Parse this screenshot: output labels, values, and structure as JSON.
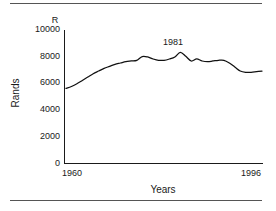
{
  "chart_data": {
    "type": "line",
    "title": "",
    "subtitle": "",
    "xlabel": "Years",
    "ylabel": "Rands",
    "unit_label": "R",
    "xlim": [
      1960,
      1996
    ],
    "ylim": [
      0,
      10000
    ],
    "grid": false,
    "legend": null,
    "y_ticks": [
      10000,
      8000,
      6000,
      4000,
      2000,
      0
    ],
    "y_tick_labels": [
      "10000",
      "8000",
      "6000",
      "4000",
      "2000",
      "0"
    ],
    "x_ticks": [
      1960,
      1996
    ],
    "x_tick_labels": [
      "1960",
      "1996"
    ],
    "annotations": [
      {
        "text": "1981",
        "x": 1981,
        "y": 9200
      }
    ],
    "series": [
      {
        "name": "Rands",
        "x": [
          1960,
          1961,
          1962,
          1963,
          1964,
          1965,
          1966,
          1967,
          1968,
          1969,
          1970,
          1971,
          1972,
          1973,
          1974,
          1975,
          1976,
          1977,
          1978,
          1979,
          1980,
          1981,
          1982,
          1983,
          1984,
          1985,
          1986,
          1987,
          1988,
          1989,
          1990,
          1991,
          1992,
          1993,
          1994,
          1995,
          1996
        ],
        "values": [
          5600,
          5750,
          5950,
          6200,
          6450,
          6700,
          6900,
          7100,
          7250,
          7400,
          7500,
          7600,
          7650,
          7700,
          7980,
          7950,
          7800,
          7700,
          7700,
          7800,
          7950,
          8300,
          8000,
          7650,
          7800,
          7650,
          7600,
          7650,
          7700,
          7700,
          7500,
          7200,
          6900,
          6800,
          6800,
          6850,
          6900
        ]
      }
    ]
  },
  "figure": {
    "top_rule": true,
    "bottom_rule": true
  }
}
